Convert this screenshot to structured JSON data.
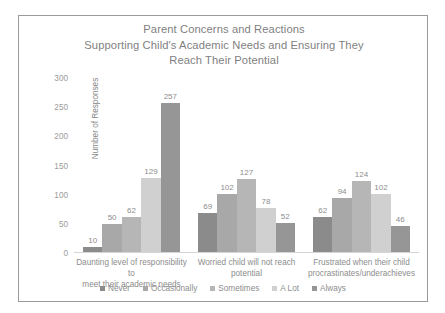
{
  "chart_data": {
    "type": "bar",
    "title": "Parent Concerns and Reactions Supporting Child's Academic Needs and Ensuring They Reach Their Potential",
    "title_lines": [
      "Parent Concerns and Reactions",
      "Supporting Child's Academic Needs and Ensuring They",
      "Reach Their Potential"
    ],
    "xlabel": "",
    "ylabel": "Number of Responses",
    "ylim": [
      0,
      300
    ],
    "yticks": [
      300,
      250,
      200,
      150,
      100,
      50,
      0
    ],
    "grid": false,
    "legend_position": "bottom",
    "categories": [
      "Daunting level of responsibility to meet their academic needs",
      "Worried child will not reach potential",
      "Frustrated when their child procrastinates/underachieves"
    ],
    "category_lines": [
      [
        "Daunting level of responsibility to",
        "meet their academic needs"
      ],
      [
        "Worried child will not reach",
        "potential"
      ],
      [
        "Frustrated when their child",
        "procrastinates/underachieves"
      ]
    ],
    "series": [
      {
        "name": "Never",
        "color": "#8b8b8b",
        "values": [
          10,
          69,
          62
        ]
      },
      {
        "name": "Occasionally",
        "color": "#a8a8a8",
        "values": [
          50,
          102,
          94
        ]
      },
      {
        "name": "Sometimes",
        "color": "#b6b6b6",
        "values": [
          62,
          127,
          124
        ]
      },
      {
        "name": "A Lot",
        "color": "#d0d0d0",
        "values": [
          129,
          78,
          102
        ]
      },
      {
        "name": "Always",
        "color": "#969696",
        "values": [
          257,
          52,
          46
        ]
      }
    ]
  },
  "colors": {
    "title_text": "#7f7f7f",
    "axis_text": "#9b9b9b",
    "label_text": "#8d8d8d",
    "border": "#9a9a9a",
    "axis_line": "#d4d4d4",
    "background": "#ffffff"
  }
}
